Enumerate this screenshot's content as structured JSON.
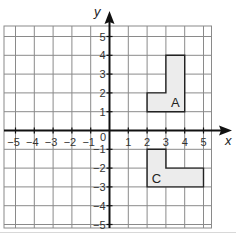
{
  "diagram": {
    "type": "coordinate-grid",
    "x_axis": {
      "label": "x",
      "min": -5,
      "max": 5,
      "tick_labels": [
        "-5",
        "-4",
        "-3",
        "-2",
        "-1",
        "1",
        "2",
        "3",
        "4",
        "5"
      ]
    },
    "y_axis": {
      "label": "y",
      "min": -5,
      "max": 5,
      "tick_labels": [
        "5",
        "4",
        "3",
        "2",
        "1",
        "-1",
        "-2",
        "-3",
        "-4",
        "-5"
      ]
    },
    "origin_label": "0",
    "shapes": [
      {
        "label": "A",
        "vertices": [
          [
            2,
            1
          ],
          [
            4,
            1
          ],
          [
            4,
            4
          ],
          [
            3,
            4
          ],
          [
            3,
            2
          ],
          [
            2,
            2
          ]
        ],
        "label_position": [
          3.5,
          1.5
        ]
      },
      {
        "label": "C",
        "vertices": [
          [
            2,
            -1
          ],
          [
            3,
            -1
          ],
          [
            3,
            -2
          ],
          [
            5,
            -2
          ],
          [
            5,
            -3
          ],
          [
            2,
            -3
          ]
        ],
        "label_position": [
          2.5,
          -2.5
        ]
      }
    ],
    "colors": {
      "grid_line": "#8a8a8a",
      "axis": "#111111",
      "shape_fill": "#ececec",
      "shape_stroke": "#222222"
    }
  }
}
